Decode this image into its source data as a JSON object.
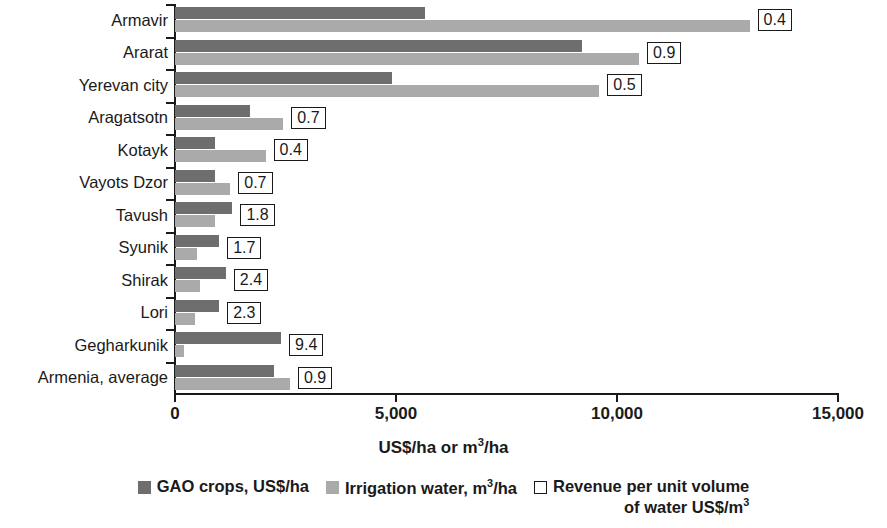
{
  "chart_data": {
    "type": "bar",
    "orientation": "horizontal",
    "title": "",
    "xlabel": "US$/ha or m3/ha",
    "ylabel": "",
    "xlim": [
      0,
      15000
    ],
    "xticks": [
      0,
      5000,
      10000,
      15000
    ],
    "xtick_labels": [
      "0",
      "5,000",
      "10,000",
      "15,000"
    ],
    "grid": false,
    "legend_position": "bottom",
    "categories": [
      "Armavir",
      "Ararat",
      "Yerevan city",
      "Aragatsotn",
      "Kotayk",
      "Vayots Dzor",
      "Tavush",
      "Syunik",
      "Shirak",
      "Lori",
      "Gegharkunik",
      "Armenia, average"
    ],
    "series": [
      {
        "name": "GAO crops, US$/ha",
        "color": "#6e6e6e",
        "values": [
          5650,
          9200,
          4900,
          1700,
          900,
          900,
          1300,
          1000,
          1150,
          1000,
          2400,
          2250
        ]
      },
      {
        "name": "Irrigation water, m3/ha",
        "color": "#aaaaaa",
        "values": [
          13000,
          10500,
          9600,
          2450,
          2050,
          1250,
          900,
          500,
          570,
          450,
          200,
          2600
        ]
      }
    ],
    "point_labels": {
      "name": "Revenue per unit volume of water  US$/m3",
      "values": [
        "0.4",
        "0.9",
        "0.5",
        "0.7",
        "0.4",
        "0.7",
        "1.8",
        "1.7",
        "2.4",
        "2.3",
        "9.4",
        "0.9"
      ]
    }
  },
  "axis": {
    "x_title_prefix": "US$/ha or m",
    "x_title_sup": "3",
    "x_title_suffix": "/ha"
  },
  "legend": {
    "items": [
      {
        "label": "GAO crops, US$/ha",
        "swatch": "dark"
      },
      {
        "label_prefix": "Irrigation water, m",
        "label_sup": "3",
        "label_suffix": "/ha",
        "swatch": "light"
      },
      {
        "label_line1": "Revenue per unit volume",
        "label_line2_prefix": "of water  US$/m",
        "label_line2_sup": "3",
        "swatch": "open"
      }
    ]
  }
}
